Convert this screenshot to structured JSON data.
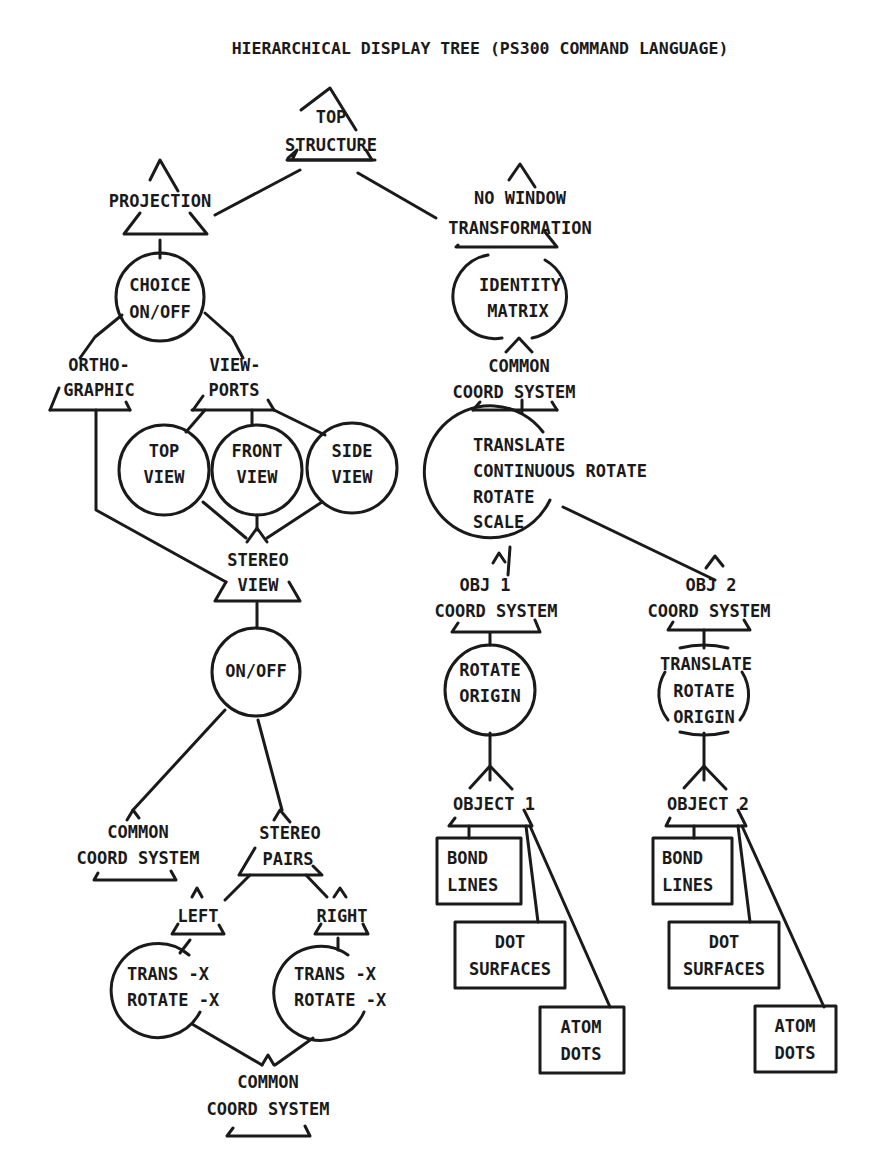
{
  "title": "HIERARCHICAL DISPLAY TREE (PS300 COMMAND LANGUAGE)",
  "colors": {
    "ink": "#1a1a1a",
    "paper": "#ffffff"
  },
  "nodes": {
    "top_structure": {
      "shape": "instance-triangle",
      "lines": [
        "TOP",
        "STRUCTURE"
      ]
    },
    "projection": {
      "shape": "instance-triangle",
      "lines": [
        "PROJECTION"
      ]
    },
    "no_window": {
      "shape": "instance-triangle",
      "lines": [
        "NO WINDOW",
        "TRANSFORMATION"
      ]
    },
    "choice": {
      "shape": "operation-circle",
      "lines": [
        "CHOICE",
        "ON/OFF"
      ]
    },
    "identity": {
      "shape": "operation-circle",
      "lines": [
        "IDENTITY",
        "MATRIX"
      ]
    },
    "orthographic": {
      "shape": "instance-triangle",
      "lines": [
        "ORTHO-",
        "GRAPHIC"
      ]
    },
    "viewports": {
      "shape": "instance-triangle",
      "lines": [
        "VIEW-",
        "PORTS"
      ]
    },
    "common_coord_right": {
      "shape": "instance-triangle",
      "lines": [
        "COMMON",
        "COORD SYSTEM"
      ]
    },
    "top_view": {
      "shape": "operation-circle",
      "lines": [
        "TOP",
        "VIEW"
      ]
    },
    "front_view": {
      "shape": "operation-circle",
      "lines": [
        "FRONT",
        "VIEW"
      ]
    },
    "side_view": {
      "shape": "operation-circle",
      "lines": [
        "SIDE",
        "VIEW"
      ]
    },
    "transforms": {
      "shape": "operation-circle",
      "lines": [
        "TRANSLATE",
        "CONTINUOUS ROTATE",
        "ROTATE",
        "SCALE"
      ]
    },
    "stereo_view": {
      "shape": "instance-triangle",
      "lines": [
        "STEREO",
        "VIEW"
      ]
    },
    "obj1_coord": {
      "shape": "instance-triangle",
      "lines": [
        "OBJ 1",
        "COORD SYSTEM"
      ]
    },
    "obj2_coord": {
      "shape": "instance-triangle",
      "lines": [
        "OBJ 2",
        "COORD SYSTEM"
      ]
    },
    "onoff": {
      "shape": "operation-circle",
      "lines": [
        "ON/OFF"
      ]
    },
    "rotate_origin": {
      "shape": "operation-circle",
      "lines": [
        "ROTATE",
        "ORIGIN"
      ]
    },
    "translate_rotate_origin": {
      "shape": "operation-circle",
      "lines": [
        "TRANSLATE",
        "ROTATE",
        "ORIGIN"
      ]
    },
    "object1": {
      "shape": "instance-triangle",
      "lines": [
        "OBJECT 1"
      ]
    },
    "object2": {
      "shape": "instance-triangle",
      "lines": [
        "OBJECT 2"
      ]
    },
    "common_coord_left": {
      "shape": "instance-triangle",
      "lines": [
        "COMMON",
        "COORD SYSTEM"
      ]
    },
    "stereo_pairs": {
      "shape": "instance-triangle",
      "lines": [
        "STEREO",
        "PAIRS"
      ]
    },
    "bond_lines_1": {
      "shape": "data-box",
      "lines": [
        "BOND",
        "LINES"
      ]
    },
    "dot_surfaces_1": {
      "shape": "data-box",
      "lines": [
        "DOT",
        "SURFACES"
      ]
    },
    "atom_dots_1": {
      "shape": "data-box",
      "lines": [
        "ATOM",
        "DOTS"
      ]
    },
    "bond_lines_2": {
      "shape": "data-box",
      "lines": [
        "BOND",
        "LINES"
      ]
    },
    "dot_surfaces_2": {
      "shape": "data-box",
      "lines": [
        "DOT",
        "SURFACES"
      ]
    },
    "atom_dots_2": {
      "shape": "data-box",
      "lines": [
        "ATOM",
        "DOTS"
      ]
    },
    "left": {
      "shape": "instance-triangle",
      "lines": [
        "LEFT"
      ]
    },
    "right": {
      "shape": "instance-triangle",
      "lines": [
        "RIGHT"
      ]
    },
    "trans_left": {
      "shape": "operation-circle",
      "lines": [
        "TRANS -X",
        "ROTATE -X"
      ]
    },
    "trans_right": {
      "shape": "operation-circle",
      "lines": [
        "TRANS -X",
        "ROTATE -X"
      ]
    },
    "common_coord_bottom": {
      "shape": "instance-triangle",
      "lines": [
        "COMMON",
        "COORD SYSTEM"
      ]
    }
  }
}
